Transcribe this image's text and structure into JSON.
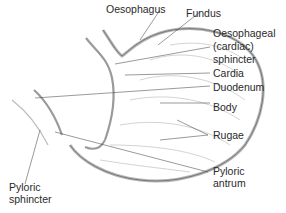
{
  "labels": {
    "oesophagus": "Oesophagus",
    "fundus": "Fundus",
    "sphincter_l1": "Oesophageal",
    "sphincter_l2": "(cardiac)",
    "sphincter_l3": "sphincter",
    "cardia": "Cardia",
    "duodenum": "Duodenum",
    "body": "Body",
    "rugae": "Rugae",
    "pyloric_antrum_l1": "Pyloric",
    "pyloric_antrum_l2": "antrum",
    "pyloric_sphincter_l1": "Pyloric",
    "pyloric_sphincter_l2": "sphincter"
  },
  "colors": {
    "wall_fill": "#cfcfcf",
    "wall_stroke": "#8a8a8a",
    "leader": "#555555",
    "text": "#2a2a2a"
  }
}
